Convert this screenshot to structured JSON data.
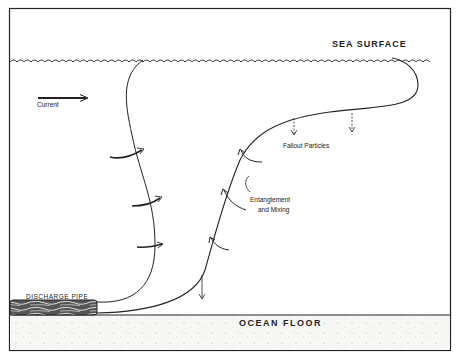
{
  "diagram": {
    "labels": {
      "sea_surface": "SEA SURFACE",
      "ocean_floor": "OCEAN FLOOR",
      "current": "Current",
      "fallout_particles": "Fallout  Particles",
      "entanglement_line1": "Entanglement",
      "entanglement_line2": "and  Mixing",
      "discharge_pipe": "DISCHARGE  PIPE"
    },
    "colors": {
      "line": "#1a1a1a",
      "background": "#ffffff",
      "sediment": "#f4f4f2"
    }
  }
}
